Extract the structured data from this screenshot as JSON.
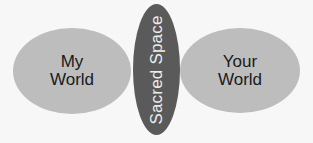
{
  "diagram": {
    "left": {
      "line1": "My",
      "line2": "World"
    },
    "center": {
      "label": "Sacred Space"
    },
    "right": {
      "line1": "Your",
      "line2": "World"
    },
    "colors": {
      "background": "#f7f7f7",
      "outer_oval": "#bdbdbd",
      "center_oval": "#5a5a5a",
      "outer_text": "#1a1a1a",
      "center_text": "#ededed"
    }
  }
}
